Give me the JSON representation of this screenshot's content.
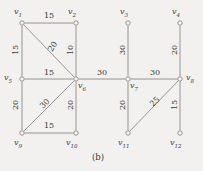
{
  "figure": {
    "caption": "(b)",
    "background_color": "#f2f1ef",
    "line_color": "#8a8a8a",
    "node_fill": "#f7f6f4",
    "text_color": "#3a3a3a"
  },
  "vertices": [
    {
      "id": "v1",
      "name": "v",
      "sub": "1",
      "x": 22,
      "y": 23,
      "label_x": 14,
      "label_y": 8
    },
    {
      "id": "v2",
      "name": "v",
      "sub": "2",
      "x": 76,
      "y": 23,
      "label_x": 68,
      "label_y": 8
    },
    {
      "id": "v3",
      "name": "v",
      "sub": "3",
      "x": 128,
      "y": 23,
      "label_x": 120,
      "label_y": 8
    },
    {
      "id": "v4",
      "name": "v",
      "sub": "4",
      "x": 180,
      "y": 23,
      "label_x": 172,
      "label_y": 8
    },
    {
      "id": "v5",
      "name": "v",
      "sub": "5",
      "x": 22,
      "y": 79,
      "label_x": 4,
      "label_y": 74
    },
    {
      "id": "v6",
      "name": "v",
      "sub": "6",
      "x": 76,
      "y": 79,
      "label_x": 78,
      "label_y": 82
    },
    {
      "id": "v7",
      "name": "v",
      "sub": "7",
      "x": 128,
      "y": 79,
      "label_x": 130,
      "label_y": 82
    },
    {
      "id": "v8",
      "name": "v",
      "sub": "8",
      "x": 180,
      "y": 79,
      "label_x": 186,
      "label_y": 74
    },
    {
      "id": "v9",
      "name": "v",
      "sub": "9",
      "x": 22,
      "y": 133,
      "label_x": 14,
      "label_y": 139
    },
    {
      "id": "v10",
      "name": "v",
      "sub": "10",
      "x": 76,
      "y": 133,
      "label_x": 66,
      "label_y": 139
    },
    {
      "id": "v11",
      "name": "v",
      "sub": "11",
      "x": 128,
      "y": 133,
      "label_x": 118,
      "label_y": 139
    },
    {
      "id": "v12",
      "name": "v",
      "sub": "12",
      "x": 180,
      "y": 133,
      "label_x": 170,
      "label_y": 139
    }
  ],
  "edges": [
    {
      "from": "v1",
      "to": "v2",
      "weight": "15",
      "label_x": 44,
      "label_y": 12,
      "rotate": 0
    },
    {
      "from": "v1",
      "to": "v5",
      "weight": "15",
      "label_x": 11,
      "label_y": 46,
      "rotate": -90
    },
    {
      "from": "v1",
      "to": "v6",
      "weight": "20",
      "label_x": 48,
      "label_y": 43,
      "rotate": -56
    },
    {
      "from": "v2",
      "to": "v6",
      "weight": "10",
      "label_x": 66,
      "label_y": 46,
      "rotate": -90
    },
    {
      "from": "v5",
      "to": "v6",
      "weight": "15",
      "label_x": 44,
      "label_y": 69,
      "rotate": 0
    },
    {
      "from": "v5",
      "to": "v9",
      "weight": "20",
      "label_x": 11,
      "label_y": 101,
      "rotate": -90
    },
    {
      "from": "v6",
      "to": "v9",
      "weight": "30",
      "label_x": 40,
      "label_y": 100,
      "rotate": -45
    },
    {
      "from": "v6",
      "to": "v10",
      "weight": "20",
      "label_x": 66,
      "label_y": 101,
      "rotate": -90
    },
    {
      "from": "v9",
      "to": "v10",
      "weight": "15",
      "label_x": 44,
      "label_y": 122,
      "rotate": 0
    },
    {
      "from": "v6",
      "to": "v7",
      "weight": "30",
      "label_x": 97,
      "label_y": 69,
      "rotate": 0
    },
    {
      "from": "v3",
      "to": "v7",
      "weight": "30",
      "label_x": 118,
      "label_y": 46,
      "rotate": -90
    },
    {
      "from": "v7",
      "to": "v8",
      "weight": "30",
      "label_x": 150,
      "label_y": 69,
      "rotate": 0
    },
    {
      "from": "v4",
      "to": "v8",
      "weight": "20",
      "label_x": 170,
      "label_y": 46,
      "rotate": -90
    },
    {
      "from": "v7",
      "to": "v11",
      "weight": "20",
      "label_x": 118,
      "label_y": 101,
      "rotate": -90
    },
    {
      "from": "v8",
      "to": "v11",
      "weight": "25",
      "label_x": 150,
      "label_y": 98,
      "rotate": -45
    },
    {
      "from": "v8",
      "to": "v12",
      "weight": "15",
      "label_x": 170,
      "label_y": 101,
      "rotate": -90
    }
  ]
}
